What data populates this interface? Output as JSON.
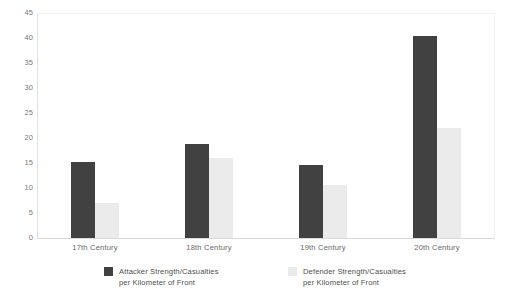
{
  "chart_data": {
    "type": "bar",
    "title": "",
    "subtitle": "",
    "xlabel": "",
    "ylabel": "",
    "categories": [
      "17th Century",
      "18th Century",
      "19th Century",
      "20th Century"
    ],
    "series": [
      {
        "name": "Attacker Strength/Casualties\nper Kilometer of Front",
        "color": "#414141",
        "values": [
          15.2,
          18.8,
          14.6,
          40.5
        ]
      },
      {
        "name": "Defender Strength/Casualties\nper Kilometer of Front",
        "color": "#ebebeb",
        "values": [
          7.0,
          16.0,
          10.6,
          22.0
        ]
      }
    ],
    "ylim": [
      0,
      45
    ],
    "ytick_step": 5,
    "yticks": [
      "0",
      "5",
      "10",
      "15",
      "20",
      "25",
      "30",
      "35",
      "40",
      "45"
    ],
    "grid": false,
    "legend_position": "bottom"
  },
  "legend": {
    "items": [
      {
        "label": "Attacker Strength/Casualties\nper Kilometer of Front",
        "swatch_color": "#414141"
      },
      {
        "label": "Defender Strength/Casualties\nper Kilometer of Front",
        "swatch_color": "#ebebeb"
      }
    ]
  },
  "colors": {
    "attacker": "#414141",
    "defender": "#ebebeb",
    "axis_text": "#7a7a7a",
    "category_text": "#676767",
    "legend_text": "#4f4f4f",
    "plot_border": "#e2e2e2",
    "background": "#ffffff"
  }
}
